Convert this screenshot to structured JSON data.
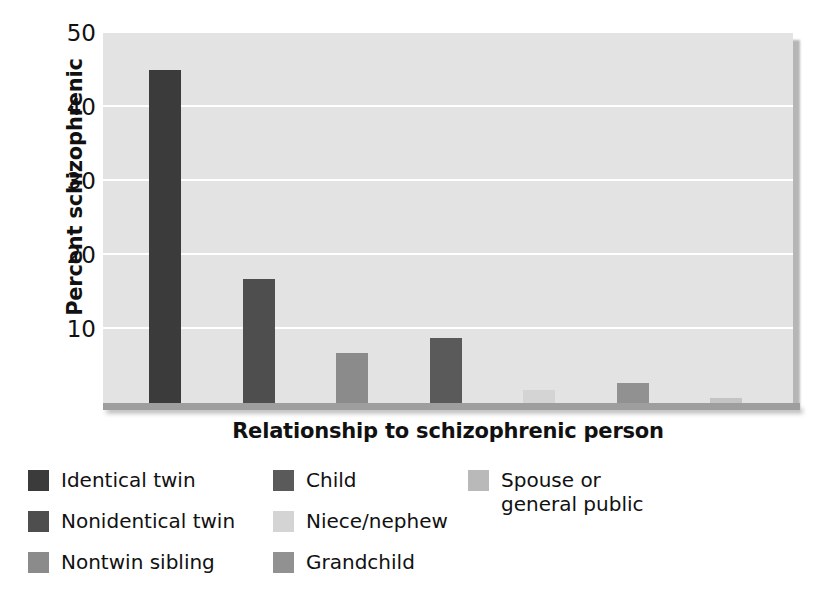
{
  "chart_data": {
    "type": "bar",
    "title": "",
    "xlabel": "Relationship to schizophrenic person",
    "ylabel": "Percent schizophrenic",
    "categories": [
      "Identical twin",
      "Nonidentical twin",
      "Nontwin sibling",
      "Child",
      "Niece/nephew",
      "Grandchild",
      "Spouse or general public"
    ],
    "values": [
      45,
      17,
      7,
      9,
      2,
      3,
      1
    ],
    "ylim": [
      0,
      50
    ],
    "yticks": [
      10,
      20,
      30,
      40,
      50
    ],
    "ytick_labels": [
      "10",
      "20",
      "30",
      "40",
      "50"
    ],
    "grid": "horizontal-white",
    "legend_position": "below-plot",
    "bar_colors": [
      "#3b3b3b",
      "#4e4e4e",
      "#8b8b8b",
      "#5a5a5a",
      "#d4d4d4",
      "#919191",
      "#c4c4c4"
    ],
    "plot_background": "#e3e3e3",
    "gridline_color": "#ffffff",
    "text_color": "#111111"
  },
  "axes": {
    "y_title": "Percent schizophrenic",
    "x_title": "Relationship to schizophrenic person",
    "y_tick_labels": [
      "50",
      "40",
      "30",
      "20",
      "10"
    ]
  },
  "legend": {
    "columns": [
      {
        "items": [
          {
            "label": "Identical twin",
            "color": "#3b3b3b"
          },
          {
            "label": "Nonidentical twin",
            "color": "#4e4e4e"
          },
          {
            "label": "Nontwin sibling",
            "color": "#8b8b8b"
          }
        ]
      },
      {
        "items": [
          {
            "label": "Child",
            "color": "#5a5a5a"
          },
          {
            "label": "Niece/nephew",
            "color": "#d4d4d4"
          },
          {
            "label": "Grandchild",
            "color": "#919191"
          }
        ]
      },
      {
        "items": [
          {
            "label": "Spouse or\ngeneral public",
            "color": "#b9b9b9"
          }
        ]
      }
    ]
  }
}
